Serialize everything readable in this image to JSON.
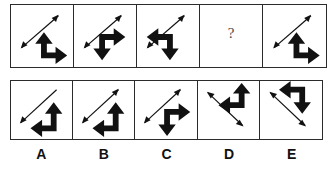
{
  "puzzle": {
    "type": "matrix-reasoning-analogy",
    "question_row": {
      "cells": [
        {
          "id": "q1",
          "thin_arrow": {
            "icon": "double-headed-diagonal-arrow",
            "direction": "up-right-down-left",
            "heads": "both"
          },
          "bold_arrow": {
            "icon": "bold-corner-arrow",
            "heads": "up-and-right",
            "position": "bottom-right"
          }
        },
        {
          "id": "q2",
          "thin_arrow": {
            "icon": "double-headed-diagonal-arrow",
            "direction": "up-right-down-left",
            "heads": "both"
          },
          "bold_arrow": {
            "icon": "bold-corner-arrow",
            "heads": "right-and-down",
            "position": "bottom-right"
          }
        },
        {
          "id": "q3",
          "thin_arrow": {
            "icon": "double-headed-diagonal-arrow",
            "direction": "up-right-down-left",
            "heads": "both"
          },
          "bold_arrow": {
            "icon": "bold-corner-arrow",
            "heads": "left-and-down",
            "position": "bottom-right"
          }
        },
        {
          "id": "q4",
          "missing": true,
          "label": "?"
        },
        {
          "id": "q5",
          "thin_arrow": {
            "icon": "double-headed-diagonal-arrow",
            "direction": "up-right-down-left",
            "heads": "both"
          },
          "bold_arrow": {
            "icon": "bold-corner-arrow",
            "heads": "up-and-right",
            "position": "bottom-right"
          }
        }
      ]
    },
    "answer_row": {
      "options": [
        {
          "id": "A",
          "label": "A",
          "thin_arrow": {
            "icon": "single-headed-diagonal-arrow",
            "direction": "up-right-down-left",
            "heads": "lower-left-only"
          },
          "bold_arrow": {
            "icon": "bold-corner-arrow",
            "heads": "left-and-up",
            "position": "bottom-right"
          }
        },
        {
          "id": "B",
          "label": "B",
          "thin_arrow": {
            "icon": "double-headed-diagonal-arrow",
            "direction": "up-right-down-left",
            "heads": "both"
          },
          "bold_arrow": {
            "icon": "bold-corner-arrow",
            "heads": "left-and-up",
            "position": "bottom-right"
          }
        },
        {
          "id": "C",
          "label": "C",
          "thin_arrow": {
            "icon": "double-headed-diagonal-arrow",
            "direction": "up-right-down-left",
            "heads": "both"
          },
          "bold_arrow": {
            "icon": "bold-corner-arrow",
            "heads": "right-and-down",
            "position": "bottom-right"
          }
        },
        {
          "id": "D",
          "label": "D",
          "thin_arrow": {
            "icon": "double-headed-diagonal-arrow",
            "direction": "up-left-down-right",
            "heads": "both"
          },
          "bold_arrow": {
            "icon": "bold-corner-arrow",
            "heads": "left-and-up",
            "position": "top-right"
          }
        },
        {
          "id": "E",
          "label": "E",
          "thin_arrow": {
            "icon": "double-headed-diagonal-arrow",
            "direction": "up-left-down-right",
            "heads": "both"
          },
          "bold_arrow": {
            "icon": "bold-corner-arrow",
            "heads": "left-and-down",
            "position": "top-right"
          }
        }
      ]
    },
    "colors": {
      "ink": "#111111",
      "border": "#2b2b2b",
      "background": "#ffffff",
      "question_mark": "#4a4a4a"
    }
  }
}
